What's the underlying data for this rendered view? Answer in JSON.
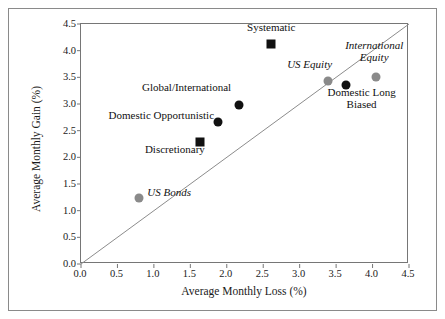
{
  "chart_data": {
    "type": "scatter",
    "title": "",
    "xlabel": "Average Monthly Loss (%)",
    "ylabel": "Average Monthly Gain (%)",
    "xlim": [
      0.0,
      4.5
    ],
    "ylim": [
      0.0,
      4.5
    ],
    "xticks": [
      "0.0",
      "0.5",
      "1.0",
      "1.5",
      "2.0",
      "2.5",
      "3.0",
      "3.5",
      "4.0",
      "4.5"
    ],
    "yticks": [
      "0.0",
      "0.5",
      "1.0",
      "1.5",
      "2.0",
      "2.5",
      "3.0",
      "3.5",
      "4.0",
      "4.5"
    ],
    "grid": false,
    "legend": "none",
    "reference_line": {
      "name": "45-degree line",
      "from": [
        0.0,
        0.0
      ],
      "to": [
        4.5,
        4.5
      ],
      "color": "#8c8c8c"
    },
    "colors": {
      "hedge_fund_marker": "#111111",
      "benchmark_marker": "#8a8a8a",
      "axis": "#767676",
      "frame": "#8a8a8a",
      "text": "#111111"
    },
    "points": [
      {
        "label": "Systematic",
        "x": 2.61,
        "y": 4.12,
        "marker": "square",
        "color": "#111111",
        "italic": false,
        "label_align": "c",
        "label_dx": 0,
        "label_dy": -17
      },
      {
        "label": "Global/International",
        "x": 2.17,
        "y": 2.98,
        "marker": "circle",
        "color": "#111111",
        "italic": false,
        "label_align": "r",
        "label_dx": -8,
        "label_dy": -18
      },
      {
        "label": "Domestic Opportunistic",
        "x": 1.88,
        "y": 2.66,
        "marker": "circle",
        "color": "#111111",
        "italic": false,
        "label_align": "r",
        "label_dx": -4,
        "label_dy": -7
      },
      {
        "label": "Discretionary",
        "x": 1.63,
        "y": 2.29,
        "marker": "square",
        "color": "#111111",
        "italic": false,
        "label_align": "r",
        "label_dx": 5,
        "label_dy": 7
      },
      {
        "label": "US Bonds",
        "x": 0.8,
        "y": 1.24,
        "marker": "circle",
        "color": "#8a8a8a",
        "italic": true,
        "label_align": "l",
        "label_dx": 8,
        "label_dy": -6
      },
      {
        "label": "US Equity",
        "x": 3.39,
        "y": 3.43,
        "marker": "circle",
        "color": "#8a8a8a",
        "italic": true,
        "label_align": "r",
        "label_dx": 4,
        "label_dy": -17
      },
      {
        "label": "Domestic Long\nBiased",
        "x": 3.63,
        "y": 3.36,
        "marker": "circle",
        "color": "#111111",
        "italic": false,
        "label_align": "c",
        "label_dx": 16,
        "label_dy": 7
      },
      {
        "label": "International\nEquity",
        "x": 4.05,
        "y": 3.51,
        "marker": "circle",
        "color": "#8a8a8a",
        "italic": true,
        "label_align": "c",
        "label_dx": -2,
        "label_dy": -32
      }
    ]
  }
}
